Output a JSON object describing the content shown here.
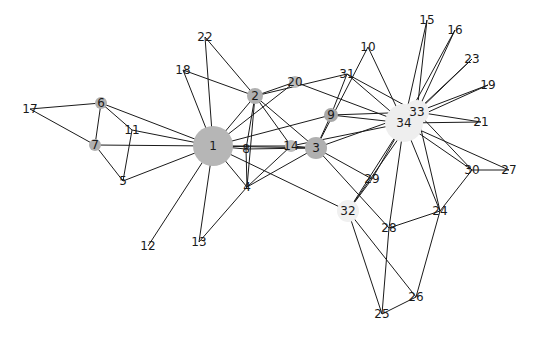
{
  "graph": {
    "title": "",
    "node_colors": {
      "hub_dark": "#b4b4b4",
      "mid": "#aaaaaa",
      "light": "#efefef",
      "none": "#ffffff"
    },
    "edge_color": "#1a1a1a",
    "nodes": [
      {
        "id": "1",
        "x": 213,
        "y": 146,
        "r": 20,
        "fill": "#b6b6b6"
      },
      {
        "id": "2",
        "x": 255,
        "y": 96,
        "r": 8,
        "fill": "#b0b0b0"
      },
      {
        "id": "3",
        "x": 316,
        "y": 148,
        "r": 11,
        "fill": "#b0b0b0"
      },
      {
        "id": "4",
        "x": 247,
        "y": 187,
        "r": 0,
        "fill": "#ffffff"
      },
      {
        "id": "5",
        "x": 123,
        "y": 181,
        "r": 0,
        "fill": "#ffffff"
      },
      {
        "id": "6",
        "x": 101,
        "y": 103,
        "r": 6,
        "fill": "#b0b0b0"
      },
      {
        "id": "7",
        "x": 95,
        "y": 145,
        "r": 6,
        "fill": "#b0b0b0"
      },
      {
        "id": "8",
        "x": 246,
        "y": 149,
        "r": 0,
        "fill": "#ffffff"
      },
      {
        "id": "9",
        "x": 331,
        "y": 115,
        "r": 7,
        "fill": "#a8a8a8"
      },
      {
        "id": "10",
        "x": 368,
        "y": 47,
        "r": 0,
        "fill": "#ffffff"
      },
      {
        "id": "11",
        "x": 132,
        "y": 130,
        "r": 0,
        "fill": "#ffffff"
      },
      {
        "id": "12",
        "x": 148,
        "y": 246,
        "r": 0,
        "fill": "#ffffff"
      },
      {
        "id": "13",
        "x": 199,
        "y": 242,
        "r": 0,
        "fill": "#ffffff"
      },
      {
        "id": "14",
        "x": 291,
        "y": 146,
        "r": 6,
        "fill": "#bcbcbc"
      },
      {
        "id": "15",
        "x": 427,
        "y": 20,
        "r": 0,
        "fill": "#ffffff"
      },
      {
        "id": "16",
        "x": 455,
        "y": 30,
        "r": 0,
        "fill": "#ffffff"
      },
      {
        "id": "17",
        "x": 30,
        "y": 109,
        "r": 0,
        "fill": "#ffffff"
      },
      {
        "id": "18",
        "x": 183,
        "y": 70,
        "r": 0,
        "fill": "#ffffff"
      },
      {
        "id": "19",
        "x": 488,
        "y": 85,
        "r": 0,
        "fill": "#ffffff"
      },
      {
        "id": "20",
        "x": 295,
        "y": 82,
        "r": 6,
        "fill": "#bcbcbc"
      },
      {
        "id": "21",
        "x": 481,
        "y": 122,
        "r": 0,
        "fill": "#ffffff"
      },
      {
        "id": "22",
        "x": 205,
        "y": 37,
        "r": 0,
        "fill": "#ffffff"
      },
      {
        "id": "23",
        "x": 472,
        "y": 59,
        "r": 0,
        "fill": "#ffffff"
      },
      {
        "id": "24",
        "x": 440,
        "y": 211,
        "r": 0,
        "fill": "#ffffff"
      },
      {
        "id": "25",
        "x": 382,
        "y": 314,
        "r": 0,
        "fill": "#ffffff"
      },
      {
        "id": "26",
        "x": 416,
        "y": 297,
        "r": 0,
        "fill": "#ffffff"
      },
      {
        "id": "27",
        "x": 509,
        "y": 170,
        "r": 0,
        "fill": "#ffffff"
      },
      {
        "id": "28",
        "x": 389,
        "y": 228,
        "r": 0,
        "fill": "#ffffff"
      },
      {
        "id": "29",
        "x": 372,
        "y": 179,
        "r": 0,
        "fill": "#ffffff"
      },
      {
        "id": "30",
        "x": 472,
        "y": 170,
        "r": 0,
        "fill": "#ffffff"
      },
      {
        "id": "31",
        "x": 347,
        "y": 74,
        "r": 0,
        "fill": "#ffffff"
      },
      {
        "id": "32",
        "x": 348,
        "y": 211,
        "r": 11,
        "fill": "#f0f0f0"
      },
      {
        "id": "33",
        "x": 417,
        "y": 112,
        "r": 12,
        "fill": "#eeeeee"
      },
      {
        "id": "34",
        "x": 404,
        "y": 123,
        "r": 19,
        "fill": "#eeeeee"
      }
    ],
    "edges": [
      [
        "1",
        "2"
      ],
      [
        "1",
        "3"
      ],
      [
        "1",
        "4"
      ],
      [
        "1",
        "5"
      ],
      [
        "1",
        "6"
      ],
      [
        "1",
        "7"
      ],
      [
        "1",
        "8"
      ],
      [
        "1",
        "9"
      ],
      [
        "1",
        "11"
      ],
      [
        "1",
        "12"
      ],
      [
        "1",
        "13"
      ],
      [
        "1",
        "14"
      ],
      [
        "1",
        "18"
      ],
      [
        "1",
        "20"
      ],
      [
        "1",
        "22"
      ],
      [
        "1",
        "32"
      ],
      [
        "2",
        "3"
      ],
      [
        "2",
        "4"
      ],
      [
        "2",
        "8"
      ],
      [
        "2",
        "14"
      ],
      [
        "2",
        "18"
      ],
      [
        "2",
        "20"
      ],
      [
        "2",
        "22"
      ],
      [
        "2",
        "31"
      ],
      [
        "3",
        "4"
      ],
      [
        "3",
        "8"
      ],
      [
        "3",
        "9"
      ],
      [
        "3",
        "10"
      ],
      [
        "3",
        "14"
      ],
      [
        "3",
        "28"
      ],
      [
        "3",
        "29"
      ],
      [
        "3",
        "33"
      ],
      [
        "4",
        "8"
      ],
      [
        "4",
        "13"
      ],
      [
        "4",
        "14"
      ],
      [
        "5",
        "7"
      ],
      [
        "5",
        "11"
      ],
      [
        "6",
        "7"
      ],
      [
        "6",
        "11"
      ],
      [
        "6",
        "17"
      ],
      [
        "7",
        "17"
      ],
      [
        "9",
        "31"
      ],
      [
        "9",
        "33"
      ],
      [
        "9",
        "34"
      ],
      [
        "10",
        "34"
      ],
      [
        "14",
        "34"
      ],
      [
        "15",
        "33"
      ],
      [
        "15",
        "34"
      ],
      [
        "16",
        "33"
      ],
      [
        "16",
        "34"
      ],
      [
        "19",
        "33"
      ],
      [
        "19",
        "34"
      ],
      [
        "20",
        "34"
      ],
      [
        "21",
        "33"
      ],
      [
        "21",
        "34"
      ],
      [
        "23",
        "33"
      ],
      [
        "23",
        "34"
      ],
      [
        "24",
        "26"
      ],
      [
        "24",
        "28"
      ],
      [
        "24",
        "30"
      ],
      [
        "24",
        "33"
      ],
      [
        "24",
        "34"
      ],
      [
        "25",
        "26"
      ],
      [
        "25",
        "28"
      ],
      [
        "25",
        "32"
      ],
      [
        "26",
        "32"
      ],
      [
        "27",
        "30"
      ],
      [
        "27",
        "34"
      ],
      [
        "28",
        "34"
      ],
      [
        "29",
        "32"
      ],
      [
        "29",
        "34"
      ],
      [
        "30",
        "33"
      ],
      [
        "30",
        "34"
      ],
      [
        "31",
        "33"
      ],
      [
        "31",
        "34"
      ],
      [
        "32",
        "33"
      ],
      [
        "32",
        "34"
      ],
      [
        "33",
        "34"
      ]
    ]
  }
}
